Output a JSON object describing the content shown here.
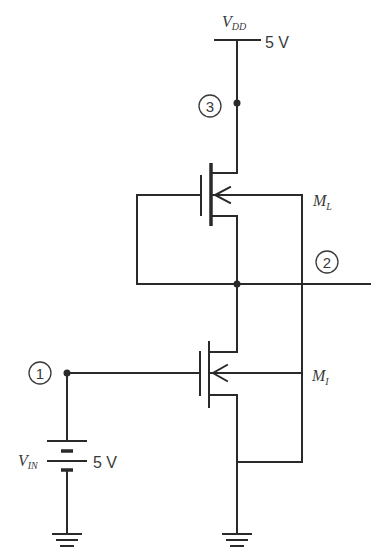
{
  "diagram": {
    "type": "circuit-schematic",
    "supply": {
      "name": "V",
      "subscript": "DD",
      "value": "5 V"
    },
    "input_source": {
      "name": "V",
      "subscript": "IN",
      "value": "5 V"
    },
    "transistors": [
      {
        "id": "load",
        "name": "M",
        "subscript": "L"
      },
      {
        "id": "driver",
        "name": "M",
        "subscript": "I"
      }
    ],
    "nodes": [
      {
        "id": "1",
        "label": "1"
      },
      {
        "id": "2",
        "label": "2"
      },
      {
        "id": "3",
        "label": "3"
      }
    ],
    "colors": {
      "wire": "#2a2a2a",
      "text": "#3a3a3a",
      "background": "#ffffff"
    }
  }
}
